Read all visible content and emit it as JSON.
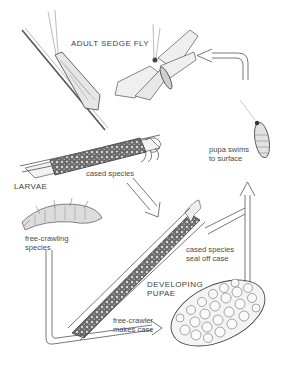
{
  "diagram": {
    "labels": {
      "adult": "ADULT SEDGE FLY",
      "larvae": "LARVAE",
      "cased_species": "cased species",
      "free_crawling": "free-crawling\nspecies",
      "cased_seal": "cased species\nseal off case",
      "developing_pupae": "DEVELOPING\nPUPAE",
      "free_crawler_case": "free-crawler\nmakes case",
      "pupa_swims": "pupa swims\nto surface"
    },
    "stages": [
      "adult sedge fly (resting)",
      "adult sedge fly (flying)",
      "cased larva",
      "free-crawling larva",
      "cased pupa",
      "free-crawler pupal case",
      "swimming pupa"
    ],
    "flow": [
      {
        "from": "cased larva",
        "to": "cased pupa"
      },
      {
        "from": "free-crawling larva",
        "to": "free-crawler pupal case"
      },
      {
        "from": "pupal cases",
        "to": "swimming pupa"
      },
      {
        "from": "swimming pupa",
        "to": "adult sedge fly"
      }
    ],
    "colors": {
      "ink": "#3a3a3a",
      "arrow": "#555555",
      "background": "#ffffff"
    }
  }
}
